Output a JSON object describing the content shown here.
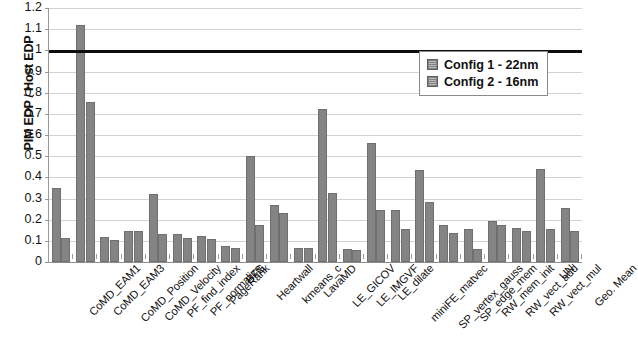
{
  "chart_data": {
    "type": "bar",
    "title": "",
    "xlabel": "",
    "ylabel": "PIM EDP / Host EDP",
    "ylim": [
      0,
      1.2
    ],
    "ytick_step": 0.1,
    "ytick_labels": [
      "1.2",
      "1.1",
      "1",
      "0.9",
      "0.8",
      "0.7",
      "0.6",
      "0.5",
      "0.4",
      "0.3",
      "0.2",
      "0.1",
      "0"
    ],
    "grid": true,
    "legend_position": "top-right",
    "reference_line": {
      "value": 1,
      "color": "#0d0d0d",
      "label": ""
    },
    "bar_color": "#848484",
    "categories": [
      "CoMD_EAM1",
      "CoMD_EAM3",
      "CoMD_Position",
      "CoMD_Velocity",
      "PF_find_index",
      "PF_normalize",
      "PageRank",
      "BFS",
      "Heartwall",
      "kmeans_c",
      "LavaMD",
      "LE_GICOV",
      "LE_IMGVF",
      "LE_dilate",
      "miniFE_matvec",
      "SP_vertex_gauss",
      "SP_edge_mem",
      "RW_mem_init",
      "RW_vect_add",
      "RW_vect_mul",
      "UN",
      "Geo. Mean"
    ],
    "series": [
      {
        "name": "Config 1 - 22nm",
        "values": [
          0.35,
          1.12,
          0.12,
          0.145,
          0.32,
          0.13,
          0.125,
          0.075,
          0.5,
          0.27,
          0.065,
          0.725,
          0.06,
          0.56,
          0.245,
          0.435,
          0.175,
          0.155,
          0.195,
          0.16,
          0.44,
          0.255
        ]
      },
      {
        "name": "Config 2 - 16nm",
        "values": [
          0.115,
          0.755,
          0.105,
          0.145,
          0.13,
          0.115,
          0.11,
          0.065,
          0.175,
          0.23,
          0.065,
          0.325,
          0.055,
          0.245,
          0.155,
          0.285,
          0.135,
          0.06,
          0.175,
          0.145,
          0.155,
          0.145
        ]
      }
    ]
  },
  "legend": {
    "entries": [
      {
        "label": "Config 1 - 22nm",
        "color": "#848484"
      },
      {
        "label": "Config 2 - 16nm",
        "color": "#848484"
      }
    ]
  }
}
